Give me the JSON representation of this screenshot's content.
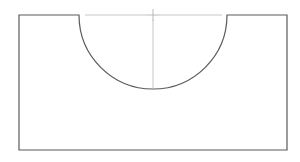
{
  "document": {
    "title": "Engineering Part Outline",
    "description": "Orthographic front view of a rectangular block with a semicircular notch machined into the top edge",
    "background_color": "#ffffff"
  },
  "drawing": {
    "view_name": "front-view",
    "units": "px",
    "canvas": {
      "width": 300,
      "height": 162
    },
    "style": {
      "outline_color": "#5a5a5a",
      "outline_width": 1.2,
      "centerline_color": "#b9b9b9",
      "centerline_width": 0.8,
      "fill_color": "#ffffff"
    },
    "profile": {
      "name": "block-with-semicircular-notch",
      "rect": {
        "left": 19,
        "top": 15,
        "right": 287,
        "bottom": 150,
        "width": 268,
        "height": 135
      },
      "notch": {
        "type": "semicircle",
        "center_x": 153,
        "center_y": 15,
        "radius": 74,
        "start_x": 79,
        "end_x": 227,
        "lowest_y": 89,
        "depth": 74
      },
      "path": "M 19 15 L 79 15 A 74 74 0 0 0 227 15 L 287 15 L 287 150 L 19 150 Z"
    },
    "centerlines": {
      "horizontal": {
        "name": "horizontal-centerline",
        "y": 15,
        "x_start": 85,
        "x_end": 222,
        "gap_start": 147,
        "gap_end": 159
      },
      "vertical": {
        "name": "vertical-centerline",
        "x": 153,
        "y_start": 20,
        "y_end": 89
      },
      "center_mark": {
        "name": "center-crosshair",
        "x": 153,
        "y": 15,
        "arm_length": 6
      }
    }
  }
}
